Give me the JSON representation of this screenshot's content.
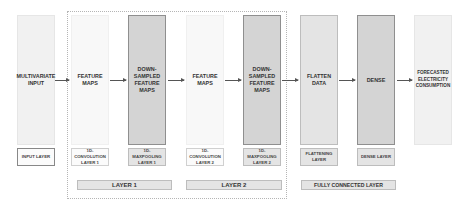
{
  "diagram": {
    "nodes": [
      {
        "id": "input",
        "label": "MULTIVARIATE INPUT",
        "layer_label": "INPUT LAYER"
      },
      {
        "id": "fm1",
        "label": "FEATURE MAPS",
        "layer_label": "1D-CONVOLUTION LAYER 1"
      },
      {
        "id": "ds1",
        "label": "DOWN-SAMPLED FEATURE MAPS",
        "layer_label": "1D-MAXPOOLING LAYER 1"
      },
      {
        "id": "fm2",
        "label": "FEATURE MAPS",
        "layer_label": "1D-CONVOLUTION LAYER 2"
      },
      {
        "id": "ds2",
        "label": "DOWN-SAMPLED FEATURE MAPS",
        "layer_label": "1D-MAXPOOLING LAYER 2"
      },
      {
        "id": "flat",
        "label": "FLATTEN DATA",
        "layer_label": "FLATTENING LAYER"
      },
      {
        "id": "dense",
        "label": "DENSE",
        "layer_label": "DENSE LAYER"
      },
      {
        "id": "out",
        "label": "FORECASTED ELECTRICITY CONSUMPTION",
        "layer_label": ""
      }
    ],
    "edges": [
      [
        "input",
        "fm1"
      ],
      [
        "fm1",
        "ds1"
      ],
      [
        "ds1",
        "fm2"
      ],
      [
        "fm2",
        "ds2"
      ],
      [
        "ds2",
        "flat"
      ],
      [
        "flat",
        "dense"
      ],
      [
        "dense",
        "out"
      ]
    ],
    "groups": [
      {
        "label": "LAYER 1",
        "members": [
          "fm1",
          "ds1"
        ]
      },
      {
        "label": "LAYER 2",
        "members": [
          "fm2",
          "ds2"
        ]
      },
      {
        "label": "FULLY CONNECTED LAYER",
        "members": [
          "flat",
          "dense"
        ]
      }
    ]
  }
}
